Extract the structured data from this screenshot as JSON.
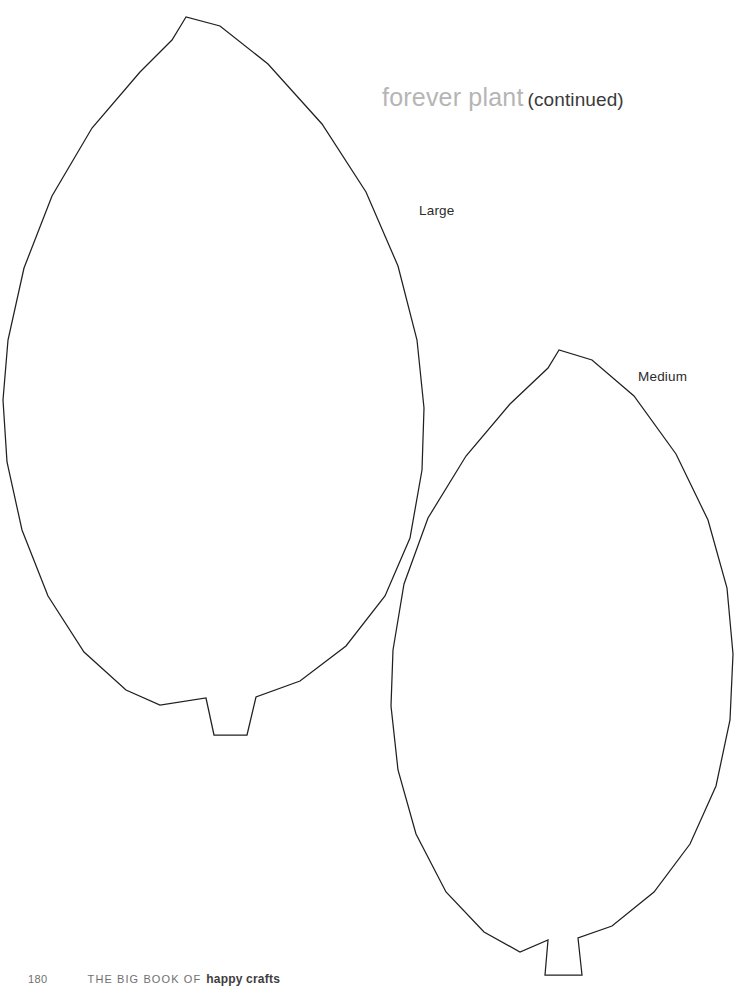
{
  "page": {
    "background_color": "#ffffff",
    "width": 753,
    "height": 986
  },
  "heading": {
    "title": "forever plant",
    "continued": "(continued)",
    "title_color": "#b5b5b5",
    "continued_color": "#3a3a3a"
  },
  "labels": {
    "large": "Large",
    "medium": "Medium",
    "color": "#2b2b2b"
  },
  "footer": {
    "page_number": "180",
    "book_prefix": "THE BIG BOOK OF",
    "book_title": "happy crafts",
    "color": "#6f6f6f"
  },
  "artwork": {
    "stroke_color": "#231f20",
    "fill_color": "#ffffff",
    "stroke_width": 1.25,
    "shapes": [
      {
        "name": "leaf-large",
        "size": "Large",
        "tip": [
          186,
          17
        ],
        "widest_left": [
          3,
          400
        ],
        "widest_right": [
          424,
          400
        ],
        "stem_base_left": [
          214,
          735
        ],
        "stem_base_right": [
          247,
          735
        ],
        "path": "M186,17 L172,40 L140,72 L92,128 L52,196 L24,268 L8,340 L3,400 L7,462 L22,530 L48,596 L84,652 L126,690 L160,705 L206,698 L214,735 L247,735 L256,697 L300,681 L346,646 L385,596 L410,538 L422,470 L424,408 L417,340 L398,266 L366,192 L322,124 L268,64 L220,26 Z"
      },
      {
        "name": "leaf-medium",
        "size": "Medium",
        "tip": [
          559,
          350
        ],
        "widest_left": [
          391,
          700
        ],
        "widest_right": [
          733,
          640
        ],
        "stem_base_left": [
          545,
          975
        ],
        "stem_base_right": [
          582,
          975
        ],
        "path": "M559,350 L548,368 L510,404 L466,456 L428,518 L404,584 L393,650 L391,706 L398,770 L416,834 L446,892 L484,932 L520,952 L548,940 L545,975 L582,975 L578,938 L612,926 L654,892 L690,844 L716,786 L730,720 L733,654 L727,588 L708,520 L676,454 L634,396 L592,360 Z"
      }
    ]
  }
}
